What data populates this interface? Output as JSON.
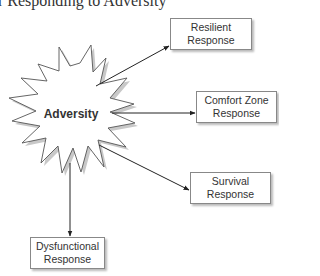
{
  "title": "r Responding to Adversity",
  "center": {
    "label": "Adversity",
    "shape": "starburst"
  },
  "responses": [
    {
      "id": "resilient",
      "line1": "Resilient",
      "line2": "Response"
    },
    {
      "id": "comfort-zone",
      "line1": "Comfort Zone",
      "line2": "Response"
    },
    {
      "id": "survival",
      "line1": "Survival",
      "line2": "Response"
    },
    {
      "id": "dysfunctional",
      "line1": "Dysfunctional",
      "line2": "Response"
    }
  ],
  "colors": {
    "line": "#222222",
    "box_border": "#888888",
    "shadow": "#bbbbbb",
    "text": "#333333"
  }
}
